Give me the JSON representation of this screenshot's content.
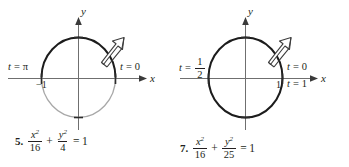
{
  "page": {
    "width": 349,
    "height": 167,
    "background": "#ffffff",
    "ink": "#231f20",
    "light_ink": "#8a8a8a"
  },
  "figures": [
    {
      "id": "figure-5",
      "number": "5.",
      "equation": {
        "x_var": "x",
        "x_den": "16",
        "plus": "+",
        "y_var": "y",
        "y_den": "4",
        "equals": "=",
        "rhs": "1",
        "exponent": "2"
      },
      "axes": {
        "x_label": "x",
        "y_label": "y"
      },
      "tick_labels": [
        {
          "name": "x-tick-negative-one",
          "text": "−1"
        }
      ],
      "param_labels": [
        {
          "name": "t-equals-pi",
          "var": "t",
          "eq": "=",
          "value": "π",
          "kind": "plain"
        },
        {
          "name": "t-equals-zero",
          "var": "t",
          "eq": "=",
          "value": "0",
          "kind": "plain"
        }
      ],
      "arrow": {
        "name": "counterclockwise-direction-arrow",
        "direction": "counterclockwise"
      },
      "curve": {
        "type": "circle",
        "traced_portion": "upper",
        "traced_color": "#231f20",
        "untraced_color": "#a3a3a3"
      }
    },
    {
      "id": "figure-7",
      "number": "7.",
      "equation": {
        "x_var": "x",
        "x_den": "16",
        "plus": "+",
        "y_var": "y",
        "y_den": "25",
        "equals": "=",
        "rhs": "1",
        "exponent": "2"
      },
      "axes": {
        "x_label": "x",
        "y_label": "y"
      },
      "tick_labels": [
        {
          "name": "x-tick-one",
          "text": "1"
        }
      ],
      "param_labels": [
        {
          "name": "t-equals-one-half",
          "var": "t",
          "eq": "=",
          "value_num": "1",
          "value_den": "2",
          "kind": "fraction"
        },
        {
          "name": "t-equals-zero",
          "var": "t",
          "eq": "=",
          "value": "0",
          "kind": "plain"
        },
        {
          "name": "t-equals-one",
          "var": "t",
          "eq": "=",
          "value": "1",
          "kind": "plain"
        }
      ],
      "arrow": {
        "name": "counterclockwise-direction-arrow",
        "direction": "counterclockwise"
      },
      "curve": {
        "type": "circle",
        "traced_portion": "full",
        "traced_color": "#231f20",
        "untraced_color": "#231f20"
      }
    }
  ]
}
